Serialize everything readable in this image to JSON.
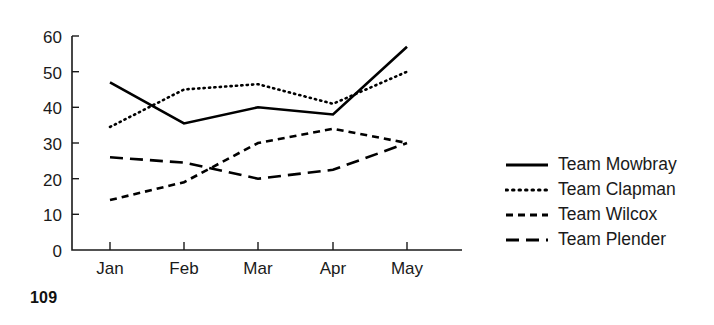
{
  "page_number": "109",
  "chart_data": {
    "type": "line",
    "title": "",
    "xlabel": "",
    "ylabel": "",
    "categories": [
      "Jan",
      "Feb",
      "Mar",
      "Apr",
      "May"
    ],
    "xtick_labels": [
      "Jan",
      "Feb",
      "Mar",
      "Apr",
      "May"
    ],
    "ytick_labels": [
      "0",
      "10",
      "20",
      "30",
      "40",
      "50",
      "60"
    ],
    "ytick_values": [
      0,
      10,
      20,
      30,
      40,
      50,
      60
    ],
    "ylim": [
      0,
      60
    ],
    "grid": false,
    "legend_position": "right",
    "series": [
      {
        "name": "Team Mowbray",
        "style": "solid",
        "color": "#000000",
        "values": [
          47,
          35.5,
          40,
          38,
          57
        ]
      },
      {
        "name": "Team Clapman",
        "style": "dotted",
        "color": "#000000",
        "values": [
          34.5,
          45,
          46.5,
          41,
          50
        ]
      },
      {
        "name": "Team Wilcox",
        "style": "short-dash",
        "color": "#000000",
        "values": [
          14,
          19,
          30,
          34,
          30
        ]
      },
      {
        "name": "Team Plender",
        "style": "long-dash",
        "color": "#000000",
        "values": [
          26,
          24.5,
          20,
          22.5,
          30
        ]
      }
    ]
  },
  "legend": {
    "items": [
      {
        "label": "Team Mowbray",
        "swatch": "solid-line-swatch"
      },
      {
        "label": "Team Clapman",
        "swatch": "dotted-line-swatch"
      },
      {
        "label": "Team Wilcox",
        "swatch": "short-dash-line-swatch"
      },
      {
        "label": "Team Plender",
        "swatch": "long-dash-line-swatch"
      }
    ]
  }
}
